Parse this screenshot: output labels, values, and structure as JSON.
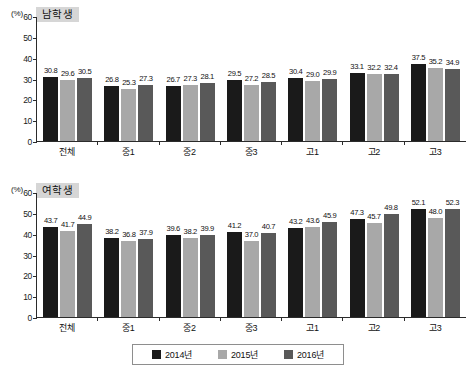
{
  "unit_label": "(%)",
  "legend": {
    "items": [
      {
        "label": "2014년",
        "color": "#1a1a1a",
        "key": "2014"
      },
      {
        "label": "2015년",
        "color": "#a8a8a8",
        "key": "2015"
      },
      {
        "label": "2016년",
        "color": "#595959",
        "key": "2016"
      }
    ]
  },
  "chart_data": [
    {
      "type": "bar",
      "title": "남학생",
      "xlabel": "",
      "ylabel": "(%)",
      "ylim": [
        0,
        60
      ],
      "yticks": [
        0,
        10,
        20,
        30,
        40,
        50,
        60
      ],
      "grid": false,
      "legend_position": "bottom",
      "categories": [
        "전체",
        "중1",
        "중2",
        "중3",
        "고1",
        "고2",
        "고3"
      ],
      "series": [
        {
          "name": "2014년",
          "color": "#1a1a1a",
          "values": [
            30.8,
            26.8,
            26.7,
            29.5,
            30.4,
            33.1,
            37.5
          ]
        },
        {
          "name": "2015년",
          "color": "#a8a8a8",
          "values": [
            29.6,
            25.3,
            27.3,
            27.2,
            29.0,
            32.2,
            35.2
          ]
        },
        {
          "name": "2016년",
          "color": "#595959",
          "values": [
            30.5,
            27.3,
            28.1,
            28.5,
            29.9,
            32.4,
            34.9
          ]
        }
      ],
      "value_labels": [
        [
          "30.8",
          "29.6",
          "30.5"
        ],
        [
          "26.8",
          "25.3",
          "27.3"
        ],
        [
          "26.7",
          "27.3",
          "28.1"
        ],
        [
          "29.5",
          "27.2",
          "28.5"
        ],
        [
          "30.4",
          "29.0",
          "29.9"
        ],
        [
          "33.1",
          "32.2",
          "32.4"
        ],
        [
          "37.5",
          "35.2",
          "34.9"
        ]
      ]
    },
    {
      "type": "bar",
      "title": "여학생",
      "xlabel": "",
      "ylabel": "(%)",
      "ylim": [
        0,
        60
      ],
      "yticks": [
        0,
        10,
        20,
        30,
        40,
        50,
        60
      ],
      "grid": false,
      "legend_position": "bottom",
      "categories": [
        "전체",
        "중1",
        "중2",
        "중3",
        "고1",
        "고2",
        "고3"
      ],
      "series": [
        {
          "name": "2014년",
          "color": "#1a1a1a",
          "values": [
            43.7,
            38.2,
            39.6,
            41.2,
            43.2,
            47.3,
            52.1
          ]
        },
        {
          "name": "2015년",
          "color": "#a8a8a8",
          "values": [
            41.7,
            36.8,
            38.2,
            37.0,
            43.6,
            45.7,
            48.0
          ]
        },
        {
          "name": "2016년",
          "color": "#595959",
          "values": [
            44.9,
            37.9,
            39.9,
            40.7,
            45.9,
            49.8,
            52.3
          ]
        }
      ],
      "value_labels": [
        [
          "43.7",
          "41.7",
          "44.9"
        ],
        [
          "38.2",
          "36.8",
          "37.9"
        ],
        [
          "39.6",
          "38.2",
          "39.9"
        ],
        [
          "41.2",
          "37.0",
          "40.7"
        ],
        [
          "43.2",
          "43.6",
          "45.9"
        ],
        [
          "47.3",
          "45.7",
          "49.8"
        ],
        [
          "52.1",
          "48.0",
          "52.3"
        ]
      ]
    }
  ]
}
